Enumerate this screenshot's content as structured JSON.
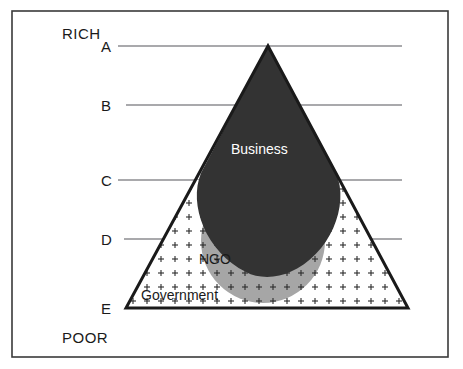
{
  "figure": {
    "type": "venn-pyramid-diagram",
    "frame": {
      "border_color": "#3a3a3a"
    },
    "colors": {
      "business_fill": "#333333",
      "ngo_fill": "#a6a6a6",
      "government_fill": "#ffffff",
      "outline": "#1a1a1a",
      "gridline": "#55555a",
      "business_label_color": "#ffffff",
      "text_color": "#1a1a1a"
    },
    "axis": {
      "top_label": "RICH",
      "bottom_label": "POOR",
      "levels": [
        {
          "label": "A",
          "y": 46
        },
        {
          "label": "B",
          "y": 105
        },
        {
          "label": "C",
          "y": 180
        },
        {
          "label": "D",
          "y": 239
        },
        {
          "label": "E",
          "y": 308
        }
      ]
    },
    "regions": [
      {
        "name": "Business",
        "label": "Business",
        "fill": "#333333",
        "label_color": "#ffffff"
      },
      {
        "name": "NGO",
        "label": "NGO",
        "fill": "#a6a6a6",
        "label_color": "#1a1a1a"
      },
      {
        "name": "Government",
        "label": "Government",
        "fill": "#ffffff",
        "label_color": "#1a1a1a"
      }
    ],
    "geometry": {
      "pyramid_apex_x": 268,
      "pyramid_apex_y": 46,
      "pyramid_left_x": 126,
      "pyramid_right_x": 408,
      "pyramid_base_y": 308,
      "ngo_circle_cx": 263,
      "ngo_circle_cy": 241,
      "ngo_circle_r": 62,
      "line_start_x": 118,
      "line_end_x": 402
    }
  }
}
